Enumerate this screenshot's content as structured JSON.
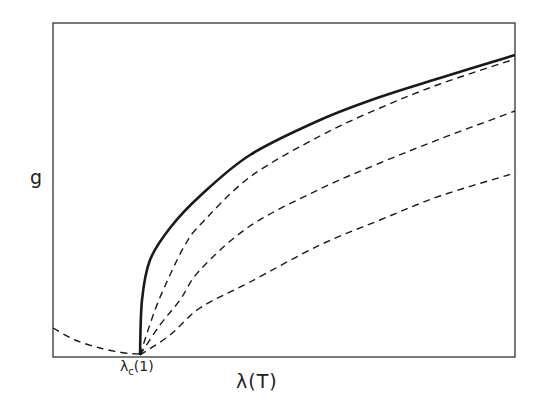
{
  "chart_data": {
    "type": "line",
    "title": "",
    "xlabel": "λ(T)",
    "ylabel": "g",
    "annotations": [
      {
        "text": "λc(1)",
        "position": "x-axis at onset of curves"
      }
    ],
    "grid": false,
    "legend": null,
    "axis_ticks": "none (schematic)",
    "series": [
      {
        "name": "solid (bold)",
        "style": "solid",
        "points_px": [
          [
            140,
            355
          ],
          [
            142,
            300
          ],
          [
            150,
            260
          ],
          [
            170,
            228
          ],
          [
            200,
            196
          ],
          [
            250,
            155
          ],
          [
            320,
            120
          ],
          [
            380,
            97
          ],
          [
            440,
            78
          ],
          [
            515,
            55
          ]
        ]
      },
      {
        "name": "dashed 1",
        "style": "dashed",
        "points_px": [
          [
            140,
            355
          ],
          [
            155,
            310
          ],
          [
            170,
            275
          ],
          [
            185,
            245
          ],
          [
            200,
            225
          ],
          [
            250,
            177
          ],
          [
            320,
            136
          ],
          [
            380,
            108
          ],
          [
            440,
            84
          ],
          [
            515,
            59
          ]
        ]
      },
      {
        "name": "dashed 2",
        "style": "dashed",
        "points_px": [
          [
            140,
            355
          ],
          [
            160,
            325
          ],
          [
            180,
            300
          ],
          [
            200,
            270
          ],
          [
            250,
            226
          ],
          [
            320,
            189
          ],
          [
            380,
            163
          ],
          [
            440,
            139
          ],
          [
            515,
            111
          ]
        ]
      },
      {
        "name": "dashed 3",
        "style": "dashed",
        "points_px": [
          [
            140,
            355
          ],
          [
            170,
            335
          ],
          [
            200,
            308
          ],
          [
            250,
            282
          ],
          [
            320,
            245
          ],
          [
            380,
            220
          ],
          [
            440,
            196
          ],
          [
            515,
            173
          ]
        ]
      },
      {
        "name": "dashed lower branch",
        "style": "dashed",
        "points_px": [
          [
            53,
            328
          ],
          [
            75,
            340
          ],
          [
            100,
            348
          ],
          [
            125,
            353
          ],
          [
            140,
            354
          ]
        ]
      }
    ],
    "plot_box_px": {
      "left": 53,
      "top": 23,
      "right": 515,
      "bottom": 357
    }
  },
  "labels": {
    "y": "g",
    "x": "λ(T)",
    "crit_main": "λ",
    "crit_sub": "c",
    "crit_arg": "(1)"
  }
}
